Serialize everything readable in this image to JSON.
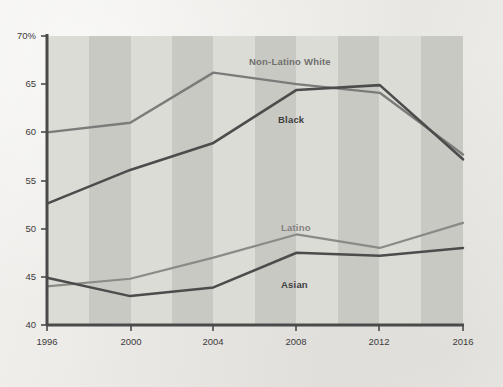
{
  "chart_data": {
    "type": "line",
    "title": "",
    "subtitle": "",
    "xlabel": "",
    "ylabel": "",
    "x": [
      1996,
      2000,
      2004,
      2008,
      2012,
      2016
    ],
    "xticklabels": [
      "1996",
      "2000",
      "2004",
      "2008",
      "2012",
      "2016"
    ],
    "xlim": [
      1996,
      2016
    ],
    "ylim": [
      40,
      70
    ],
    "yticks": [
      40,
      45,
      50,
      55,
      60,
      65,
      70
    ],
    "yticklabels": [
      "40",
      "45",
      "50",
      "55",
      "60",
      "65",
      "70%"
    ],
    "grid": false,
    "banded_background": true,
    "legend": "inline-series-labels",
    "series": [
      {
        "name": "Non-Latino White",
        "color": "#7b7b79",
        "values": [
          60.0,
          61.0,
          66.2,
          65.0,
          64.1,
          57.7
        ],
        "label_x": 2008,
        "label_y": 67.6
      },
      {
        "name": "Black",
        "color": "#4c4c4c",
        "values": [
          52.6,
          56.1,
          58.9,
          64.4,
          64.9,
          57.2
        ],
        "label_x": 2007,
        "label_y": 61.4
      },
      {
        "name": "Latino",
        "color": "#8a8a87",
        "values": [
          44.0,
          44.8,
          47.0,
          49.4,
          48.0,
          50.6
        ],
        "label_x": 2008,
        "label_y": 51.4
      },
      {
        "name": "Asian",
        "color": "#4c4c4c",
        "values": [
          44.9,
          43.0,
          43.9,
          47.5,
          47.2,
          48.0
        ],
        "label_x": 2008,
        "label_y": 45.3
      }
    ]
  },
  "axes": {
    "y_tick_labels": [
      "70%",
      "65",
      "60",
      "55",
      "50",
      "45",
      "40"
    ],
    "x_tick_labels": [
      "1996",
      "2000",
      "2004",
      "2008",
      "2012",
      "2016"
    ]
  },
  "colors": {
    "background": "#efeee9",
    "band_light": "#dededa",
    "band_dark": "#cbcbc6",
    "axis": "#4a4a4a",
    "text": "#3b3b3b"
  }
}
